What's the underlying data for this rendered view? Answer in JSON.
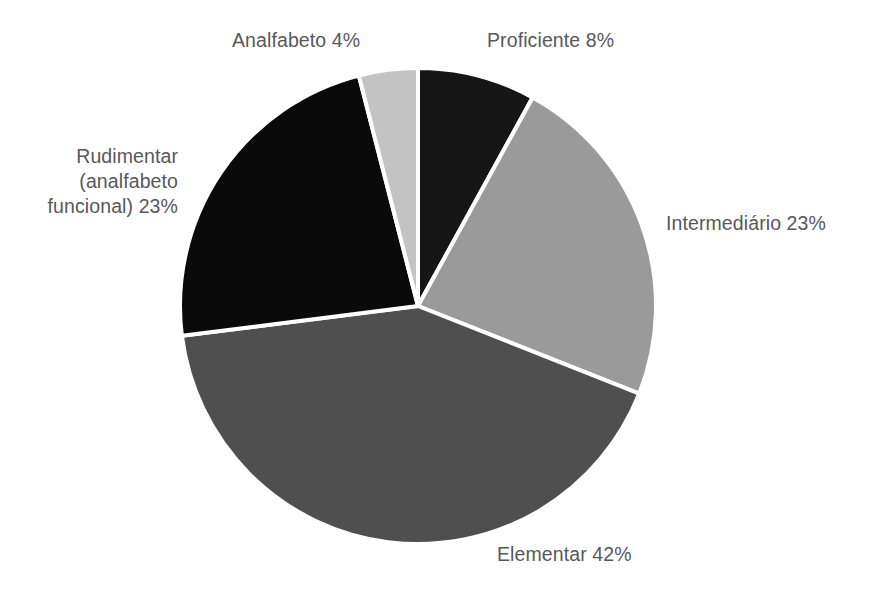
{
  "chart_data": {
    "type": "pie",
    "title": "",
    "categories": [
      "Proficiente",
      "Intermediário",
      "Elementar",
      "Rudimentar (analfabeto funcional)",
      "Analfabeto"
    ],
    "values": [
      8,
      23,
      42,
      23,
      4
    ],
    "value_unit": "%",
    "start_angle_deg": 0,
    "direction": "clockwise",
    "legend": "none",
    "labels_position": "outside",
    "separator_color": "#ffffff",
    "separator_width_px": 4,
    "background_color": "#ffffff",
    "label_text_color": "#58585a",
    "slices": [
      {
        "name": "Proficiente",
        "label": "Proficiente 8%",
        "value": 8,
        "color": "#161616",
        "start_pct": 0,
        "end_pct": 8
      },
      {
        "name": "Intermediario",
        "label": "Intermediário 23%",
        "value": 23,
        "color": "#9a9a9a",
        "start_pct": 8,
        "end_pct": 31
      },
      {
        "name": "Elementar",
        "label": "Elementar 42%",
        "value": 42,
        "color": "#4f4f4f",
        "start_pct": 31,
        "end_pct": 73
      },
      {
        "name": "Rudimentar",
        "label": "Rudimentar (analfabeto funcional) 23%",
        "value": 23,
        "color": "#0a0a0a",
        "start_pct": 73,
        "end_pct": 96
      },
      {
        "name": "Analfabeto",
        "label": "Analfabeto 4%",
        "value": 4,
        "color": "#c3c3c3",
        "start_pct": 96,
        "end_pct": 100
      }
    ]
  },
  "labels": {
    "analfabeto": "Analfabeto 4%",
    "proficiente": "Proficiente 8%",
    "intermediario": "Intermediário 23%",
    "elementar": "Elementar 42%",
    "rudimentar_line1": "Rudimentar",
    "rudimentar_line2": "(analfabeto",
    "rudimentar_line3": "funcional) 23%"
  }
}
